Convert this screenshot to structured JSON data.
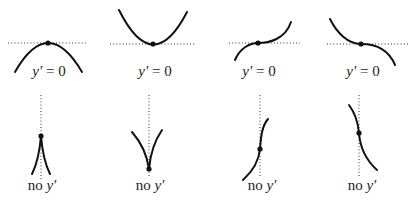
{
  "diagram": {
    "title": "",
    "top_row": {
      "caption": "y′ = 0",
      "panels": [
        {
          "kind": "local-maximum",
          "label_var": "y′",
          "label_rest": " = 0"
        },
        {
          "kind": "local-minimum",
          "label_var": "y′",
          "label_rest": " = 0"
        },
        {
          "kind": "horizontal-inflection-rising",
          "label_var": "y′",
          "label_rest": " = 0"
        },
        {
          "kind": "horizontal-inflection-falling",
          "label_var": "y′",
          "label_rest": " = 0"
        }
      ]
    },
    "bottom_row": {
      "caption": "no y′",
      "panels": [
        {
          "kind": "cusp-up",
          "label_prefix": "no ",
          "label_var": "y′"
        },
        {
          "kind": "cusp-down",
          "label_prefix": "no ",
          "label_var": "y′"
        },
        {
          "kind": "vertical-tangent-rising",
          "label_prefix": "no ",
          "label_var": "y′"
        },
        {
          "kind": "vertical-tangent-falling",
          "label_prefix": "no ",
          "label_var": "y′"
        }
      ]
    },
    "colors": {
      "curve": "#111111",
      "guide": "#333333",
      "background": "#ffffff"
    }
  }
}
